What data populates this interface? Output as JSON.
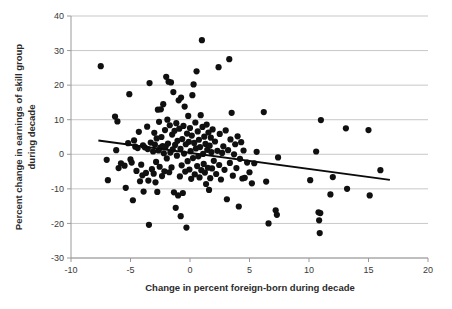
{
  "chart_data": {
    "type": "scatter",
    "title": "",
    "xlabel": "Change in percent foreign-born during decade",
    "ylabel": "Percent change in earnings of skill group during decade",
    "xlim": [
      -10,
      20
    ],
    "ylim": [
      -30,
      40
    ],
    "xticks": [
      -10,
      -5,
      0,
      5,
      10,
      15,
      20
    ],
    "yticks": [
      -30,
      -20,
      -10,
      0,
      10,
      20,
      30,
      40
    ],
    "xticklabels": [
      "-10",
      "-5",
      "0",
      "5",
      "10",
      "15",
      "20"
    ],
    "yticklabels": [
      "-30",
      "-20",
      "-10",
      "0",
      "10",
      "20",
      "30",
      "40"
    ],
    "grid": "horizontal",
    "legend": "none",
    "marker_color": "#101010",
    "marker_size": 3.1,
    "gridline_color": "#b9b9b9",
    "trendline": {
      "type": "linear-fit",
      "color": "#0b0b0b",
      "x_start": -7.7,
      "y_start": 4.0,
      "x_end": 16.8,
      "y_end": -7.4,
      "slope": -0.465,
      "intercept": 0.42
    },
    "points": [
      [
        -7.5,
        25.5
      ],
      [
        -7.0,
        -1.6
      ],
      [
        -6.9,
        -7.5
      ],
      [
        -6.3,
        10.9
      ],
      [
        -6.2,
        1.2
      ],
      [
        -6.1,
        9.5
      ],
      [
        -6.0,
        -4.0
      ],
      [
        -5.8,
        -2.6
      ],
      [
        -5.5,
        -3.3
      ],
      [
        -5.4,
        -9.7
      ],
      [
        -5.2,
        3.2
      ],
      [
        -5.1,
        17.4
      ],
      [
        -5.0,
        -1.5
      ],
      [
        -4.9,
        -2.4
      ],
      [
        -4.8,
        -13.3
      ],
      [
        -4.7,
        4.0
      ],
      [
        -4.6,
        2.2
      ],
      [
        -4.5,
        -4.8
      ],
      [
        -4.4,
        1.8
      ],
      [
        -4.3,
        6.5
      ],
      [
        -4.2,
        -7.8
      ],
      [
        -4.1,
        -3.0
      ],
      [
        -4.0,
        -6.1
      ],
      [
        -3.95,
        2.6
      ],
      [
        -3.9,
        -10.8
      ],
      [
        -3.8,
        2.0
      ],
      [
        -3.7,
        -5.4
      ],
      [
        -3.6,
        8.0
      ],
      [
        -3.55,
        1.5
      ],
      [
        -3.5,
        -7.6
      ],
      [
        -3.45,
        -20.4
      ],
      [
        -3.4,
        20.6
      ],
      [
        -3.3,
        3.4
      ],
      [
        -3.2,
        -4.3
      ],
      [
        -3.1,
        0.8
      ],
      [
        -3.05,
        -5.6
      ],
      [
        -3.0,
        6.2
      ],
      [
        -2.95,
        2.8
      ],
      [
        -2.9,
        -8.1
      ],
      [
        -2.85,
        -2.2
      ],
      [
        -2.8,
        4.6
      ],
      [
        -2.75,
        -10.9
      ],
      [
        -2.7,
        12.9
      ],
      [
        -2.65,
        1.1
      ],
      [
        -2.6,
        9.4
      ],
      [
        -2.55,
        -3.6
      ],
      [
        -2.5,
        1.9
      ],
      [
        -2.45,
        13.0
      ],
      [
        -2.4,
        5.0
      ],
      [
        -2.35,
        -6.3
      ],
      [
        -2.3,
        2.4
      ],
      [
        -2.25,
        14.5
      ],
      [
        -2.2,
        0.3
      ],
      [
        -2.15,
        -4.9
      ],
      [
        -2.1,
        7.0
      ],
      [
        -2.05,
        2.2
      ],
      [
        -2.0,
        22.4
      ],
      [
        -1.95,
        -1.2
      ],
      [
        -1.9,
        10.0
      ],
      [
        -1.85,
        3.1
      ],
      [
        -1.8,
        21.0
      ],
      [
        -1.75,
        -5.2
      ],
      [
        -1.7,
        8.4
      ],
      [
        -1.65,
        0.5
      ],
      [
        -1.6,
        20.8
      ],
      [
        -1.55,
        -3.8
      ],
      [
        -1.5,
        5.7
      ],
      [
        -1.45,
        1.4
      ],
      [
        -1.4,
        18.0
      ],
      [
        -1.35,
        -11.0
      ],
      [
        -1.3,
        6.8
      ],
      [
        -1.25,
        2.7
      ],
      [
        -1.2,
        -15.5
      ],
      [
        -1.15,
        9.0
      ],
      [
        -1.1,
        -0.4
      ],
      [
        -1.05,
        3.9
      ],
      [
        -1.0,
        -11.9
      ],
      [
        -0.95,
        15.6
      ],
      [
        -0.9,
        7.4
      ],
      [
        -0.85,
        -6.4
      ],
      [
        -0.8,
        1.6
      ],
      [
        -0.78,
        -17.9
      ],
      [
        -0.75,
        16.4
      ],
      [
        -0.7,
        -3.2
      ],
      [
        -0.65,
        4.4
      ],
      [
        -0.6,
        -11.2
      ],
      [
        -0.55,
        8.2
      ],
      [
        -0.5,
        0.2
      ],
      [
        -0.45,
        13.8
      ],
      [
        -0.4,
        -5.0
      ],
      [
        -0.35,
        2.9
      ],
      [
        -0.3,
        -21.2
      ],
      [
        -0.25,
        6.0
      ],
      [
        -0.2,
        -2.0
      ],
      [
        -0.15,
        11.1
      ],
      [
        -0.1,
        3.6
      ],
      [
        -0.05,
        -4.4
      ],
      [
        0.0,
        7.6
      ],
      [
        0.05,
        0.9
      ],
      [
        0.1,
        -7.1
      ],
      [
        0.15,
        5.4
      ],
      [
        0.2,
        17.1
      ],
      [
        0.25,
        -1.1
      ],
      [
        0.3,
        20.2
      ],
      [
        0.35,
        3.3
      ],
      [
        0.4,
        -5.8
      ],
      [
        0.45,
        9.2
      ],
      [
        0.5,
        1.7
      ],
      [
        0.55,
        24.0
      ],
      [
        0.6,
        -3.4
      ],
      [
        0.65,
        6.6
      ],
      [
        0.7,
        -0.6
      ],
      [
        0.75,
        4.2
      ],
      [
        0.8,
        -6.7
      ],
      [
        0.85,
        2.1
      ],
      [
        0.9,
        11.3
      ],
      [
        0.95,
        -4.6
      ],
      [
        1.0,
        33.0
      ],
      [
        1.05,
        7.9
      ],
      [
        1.1,
        0.1
      ],
      [
        1.15,
        -2.8
      ],
      [
        1.2,
        5.1
      ],
      [
        1.25,
        -5.3
      ],
      [
        1.3,
        3.0
      ],
      [
        1.35,
        -8.6
      ],
      [
        1.4,
        8.6
      ],
      [
        1.45,
        1.3
      ],
      [
        1.5,
        -3.9
      ],
      [
        1.55,
        6.3
      ],
      [
        1.6,
        -10.3
      ],
      [
        1.65,
        2.5
      ],
      [
        1.7,
        -6.9
      ],
      [
        1.75,
        4.8
      ],
      [
        1.8,
        0.6
      ],
      [
        1.85,
        -4.1
      ],
      [
        1.9,
        7.2
      ],
      [
        2.0,
        -1.9
      ],
      [
        2.1,
        3.7
      ],
      [
        2.2,
        -5.7
      ],
      [
        2.3,
        1.0
      ],
      [
        2.4,
        25.2
      ],
      [
        2.45,
        -3.1
      ],
      [
        2.5,
        5.9
      ],
      [
        2.6,
        -7.3
      ],
      [
        2.7,
        0.4
      ],
      [
        2.8,
        2.3
      ],
      [
        2.9,
        -4.5
      ],
      [
        3.0,
        6.9
      ],
      [
        3.1,
        -13.0
      ],
      [
        3.2,
        1.2
      ],
      [
        3.3,
        27.5
      ],
      [
        3.35,
        -2.5
      ],
      [
        3.4,
        4.3
      ],
      [
        3.5,
        12.0
      ],
      [
        3.6,
        -6.2
      ],
      [
        3.7,
        0.0
      ],
      [
        3.8,
        2.9
      ],
      [
        3.9,
        -4.0
      ],
      [
        4.0,
        5.2
      ],
      [
        4.1,
        -15.1
      ],
      [
        4.2,
        -1.3
      ],
      [
        4.3,
        3.5
      ],
      [
        4.4,
        -7.0
      ],
      [
        4.5,
        1.1
      ],
      [
        4.6,
        -6.8
      ],
      [
        4.8,
        -2.4
      ],
      [
        5.0,
        -5.2
      ],
      [
        5.2,
        -8.4
      ],
      [
        5.4,
        -2.6
      ],
      [
        5.6,
        0.7
      ],
      [
        6.2,
        12.2
      ],
      [
        6.4,
        -7.9
      ],
      [
        6.6,
        -20.0
      ],
      [
        7.2,
        -16.2
      ],
      [
        7.3,
        -17.5
      ],
      [
        7.4,
        -0.9
      ],
      [
        10.1,
        -7.5
      ],
      [
        10.6,
        0.8
      ],
      [
        10.8,
        -16.8
      ],
      [
        10.85,
        -19.1
      ],
      [
        10.9,
        -22.8
      ],
      [
        10.95,
        -17.0
      ],
      [
        11.0,
        9.9
      ],
      [
        11.8,
        -11.6
      ],
      [
        12.0,
        -6.6
      ],
      [
        13.1,
        7.5
      ],
      [
        13.2,
        -10.0
      ],
      [
        15.0,
        7.0
      ],
      [
        15.1,
        -11.9
      ],
      [
        16.0,
        -4.6
      ]
    ]
  },
  "axes": {
    "x_title": "Change in percent foreign-born during decade",
    "y_title_line1": "Percent change in earnings of skill group",
    "y_title_line2": "during decade"
  }
}
